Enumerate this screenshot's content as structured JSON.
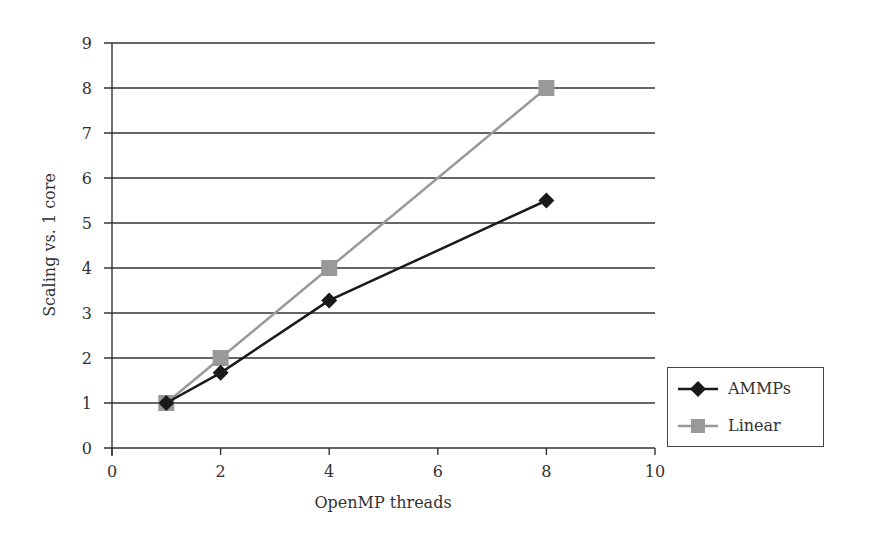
{
  "chart_data": {
    "type": "line",
    "title": "",
    "xlabel": "OpenMP threads",
    "ylabel": "Scaling vs. 1 core",
    "xlim": [
      0,
      10
    ],
    "ylim": [
      0,
      9
    ],
    "x_ticks": [
      0,
      2,
      4,
      6,
      8,
      10
    ],
    "y_ticks": [
      0,
      1,
      2,
      3,
      4,
      5,
      6,
      7,
      8,
      9
    ],
    "grid": {
      "horizontal": true,
      "vertical": false
    },
    "legend_position": "right-bottom",
    "x": [
      1,
      2,
      4,
      8
    ],
    "series": [
      {
        "name": "AMMPs",
        "values": [
          1.0,
          1.67,
          3.28,
          5.5
        ],
        "color": "#1a1a1a",
        "marker": "diamond"
      },
      {
        "name": "Linear",
        "values": [
          1,
          2,
          4,
          8
        ],
        "color": "#999999",
        "marker": "square"
      }
    ]
  },
  "legend": {
    "items": [
      {
        "label": "AMMPs"
      },
      {
        "label": "Linear"
      }
    ]
  }
}
